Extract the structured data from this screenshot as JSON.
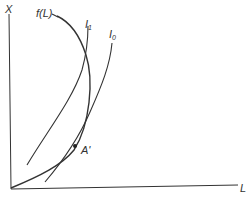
{
  "diagram": {
    "y_axis_label": "X",
    "x_axis_label": "L",
    "curve_labels": {
      "f": "f(L)",
      "i1_base": "I",
      "i1_sub": "1",
      "i0_base": "I",
      "i0_sub": "0"
    },
    "point_label": "A'",
    "colors": {
      "ink": "#333333",
      "background": "#ffffff"
    }
  }
}
